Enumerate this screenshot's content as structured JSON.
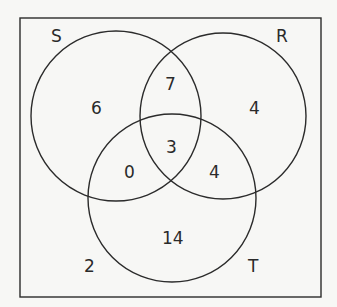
{
  "diagram": {
    "type": "venn-3-set",
    "sets": {
      "S": {
        "label": "S"
      },
      "R": {
        "label": "R"
      },
      "T": {
        "label": "T"
      }
    },
    "regions": {
      "S_only": "6",
      "R_only": "4",
      "T_only": "14",
      "S_and_R_only": "7",
      "S_and_T_only": "0",
      "R_and_T_only": "4",
      "S_and_R_and_T": "3",
      "outside": "2"
    },
    "colors": {
      "stroke": "#2b2b2b",
      "background": "#f7f7f5",
      "text": "#2a2a2a"
    }
  }
}
